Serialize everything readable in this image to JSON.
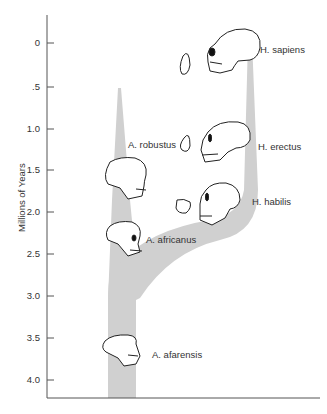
{
  "diagram": {
    "type": "hominid-phylogeny",
    "axis": {
      "title": "Millions of Years",
      "ticks": [
        "0",
        ".5",
        "1.0",
        "1.5",
        "2.0",
        "2.5",
        "3.0",
        "3.5",
        "4.0"
      ]
    },
    "species": [
      {
        "name": "H. sapiens",
        "time_mya": 0.2
      },
      {
        "name": "H. erectus",
        "time_mya": 1.3
      },
      {
        "name": "H. habilis",
        "time_mya": 1.9
      },
      {
        "name": "A. robustus",
        "time_mya": 1.3
      },
      {
        "name": "A. africanus",
        "time_mya": 2.4
      },
      {
        "name": "A. afarensis",
        "time_mya": 3.6
      }
    ],
    "colors": {
      "branch": "#d0d0d0",
      "line": "#333333"
    }
  }
}
